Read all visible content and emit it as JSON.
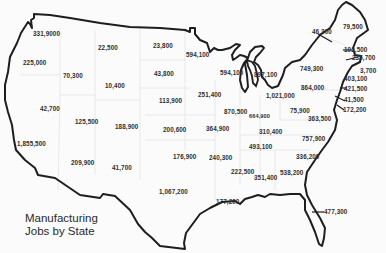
{
  "title": {
    "line1": "Manufacturing",
    "line2": "Jobs by State"
  },
  "colors": {
    "outline": "#1e1e1e",
    "label_text": "#2f2f2f",
    "background": "#fbfbfb",
    "state_borders": "#e4e4e4"
  },
  "labels": [
    {
      "id": "washington",
      "value": "331,9000",
      "x": 33,
      "y": 31
    },
    {
      "id": "oregon",
      "value": "225,000",
      "x": 23,
      "y": 60
    },
    {
      "id": "idaho",
      "value": "70,300",
      "x": 63,
      "y": 73
    },
    {
      "id": "montana",
      "value": "22,500",
      "x": 98,
      "y": 45
    },
    {
      "id": "wyoming",
      "value": "10,400",
      "x": 105,
      "y": 83
    },
    {
      "id": "nevada",
      "value": "42,700",
      "x": 40,
      "y": 106
    },
    {
      "id": "utah",
      "value": "125,500",
      "x": 75,
      "y": 119
    },
    {
      "id": "colorado",
      "value": "188,900",
      "x": 115,
      "y": 124
    },
    {
      "id": "california",
      "value": "1,855,500",
      "x": 17,
      "y": 141
    },
    {
      "id": "arizona",
      "value": "209,900",
      "x": 71,
      "y": 160
    },
    {
      "id": "new-mexico",
      "value": "41,700",
      "x": 112,
      "y": 165
    },
    {
      "id": "north-dakota",
      "value": "23,800",
      "x": 153,
      "y": 43
    },
    {
      "id": "south-dakota",
      "value": "43,800",
      "x": 154,
      "y": 71
    },
    {
      "id": "nebraska",
      "value": "113,900",
      "x": 159,
      "y": 98
    },
    {
      "id": "kansas",
      "value": "200,600",
      "x": 163,
      "y": 127
    },
    {
      "id": "oklahoma",
      "value": "176,900",
      "x": 173,
      "y": 154
    },
    {
      "id": "texas",
      "value": "1,067,200",
      "x": 159,
      "y": 189
    },
    {
      "id": "minnesota",
      "value": "594,100",
      "x": 186,
      "y": 52
    },
    {
      "id": "iowa",
      "value": "251,400",
      "x": 198,
      "y": 92
    },
    {
      "id": "missouri",
      "value": "364,900",
      "x": 206,
      "y": 126
    },
    {
      "id": "arkansas",
      "value": "240,300",
      "x": 209,
      "y": 155
    },
    {
      "id": "louisiana",
      "value": "177,200",
      "x": 216,
      "y": 199
    },
    {
      "id": "wisconsin",
      "value": "594,100",
      "x": 220,
      "y": 70
    },
    {
      "id": "michigan",
      "value": "897,100",
      "x": 254,
      "y": 72
    },
    {
      "id": "illinois",
      "value": "870,500",
      "x": 224,
      "y": 109
    },
    {
      "id": "indiana",
      "value": "664,900",
      "x": 249,
      "y": 114
    },
    {
      "id": "ohio",
      "value": "1,021,000",
      "x": 266,
      "y": 93
    },
    {
      "id": "kentucky",
      "value": "310,400",
      "x": 259,
      "y": 129
    },
    {
      "id": "tennessee",
      "value": "493,100",
      "x": 249,
      "y": 144
    },
    {
      "id": "mississippi",
      "value": "222,500",
      "x": 231,
      "y": 169
    },
    {
      "id": "alabama",
      "value": "351,400",
      "x": 254,
      "y": 175
    },
    {
      "id": "georgia",
      "value": "538,200",
      "x": 280,
      "y": 170
    },
    {
      "id": "pennsylvania",
      "value": "864,000",
      "x": 301,
      "y": 85
    },
    {
      "id": "west-virginia",
      "value": "75,900",
      "x": 290,
      "y": 108
    },
    {
      "id": "virginia",
      "value": "363,500",
      "x": 308,
      "y": 116
    },
    {
      "id": "north-carolina",
      "value": "757,900",
      "x": 302,
      "y": 136
    },
    {
      "id": "south-carolina",
      "value": "336,200",
      "x": 296,
      "y": 154
    },
    {
      "id": "florida",
      "value": "477,300",
      "x": 320,
      "y": 209
    },
    {
      "id": "new-york",
      "value": "749,300",
      "x": 300,
      "y": 66
    },
    {
      "id": "vermont",
      "value": "46,300",
      "x": 312,
      "y": 29
    },
    {
      "id": "maine",
      "value": "79,500",
      "x": 343,
      "y": 24
    },
    {
      "id": "new-hampshire",
      "value": "102,500",
      "x": 344,
      "y": 47
    },
    {
      "id": "massachusetts",
      "value": "235,700",
      "x": 352,
      "y": 55
    },
    {
      "id": "rhode-island",
      "value": "3,700",
      "x": 360,
      "y": 68
    },
    {
      "id": "connecticut",
      "value": "403,100",
      "x": 344,
      "y": 76
    },
    {
      "id": "new-jersey",
      "value": "421,500",
      "x": 344,
      "y": 86
    },
    {
      "id": "delaware",
      "value": "41,500",
      "x": 344,
      "y": 97
    },
    {
      "id": "maryland",
      "value": "172,200",
      "x": 343,
      "y": 107
    }
  ]
}
